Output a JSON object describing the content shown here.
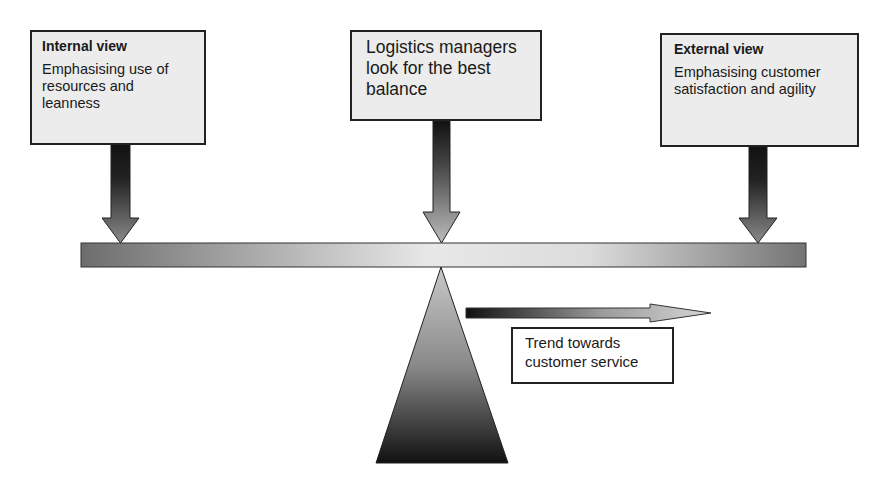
{
  "diagram": {
    "type": "balance-seesaw",
    "boxes": {
      "internal": {
        "title": "Internal view",
        "body": "Emphasising use of resources and leanness"
      },
      "middle": {
        "body": "Logistics managers look for the best balance"
      },
      "external": {
        "title": "External view",
        "body": "Emphasising customer satisfaction and agility"
      }
    },
    "trend": {
      "label": "Trend towards customer service"
    },
    "colors": {
      "box_fill": "#ececec",
      "border": "#222222",
      "beam_dark": "#6a6a6a",
      "beam_light": "#e6e6e6",
      "arrow_dark": "#111111",
      "arrow_light": "#bbbbbb"
    }
  }
}
